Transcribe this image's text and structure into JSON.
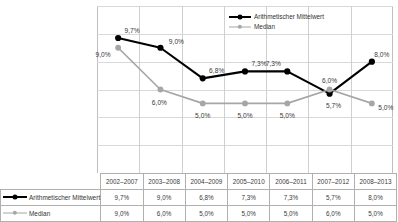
{
  "chart_data": {
    "type": "line",
    "title": "",
    "subtitle": "",
    "xlabel": "",
    "ylabel": "",
    "ylim": [
      0,
      12
    ],
    "ytick_step": 2,
    "ytick_labels": [
      "0,0%",
      "2,0%",
      "4,0%",
      "6,0%",
      "8,0%",
      "10,0%",
      "12,0%"
    ],
    "ytick_values": [
      0,
      2,
      4,
      6,
      8,
      10,
      12
    ],
    "grid": true,
    "legend_position": "top-right",
    "categories": [
      "2002–2007",
      "2003–2008",
      "2004–2009",
      "2005–2010",
      "2006–2011",
      "2007–2012",
      "2008–2013"
    ],
    "series": [
      {
        "name": "Arithmetischer Mittelwert",
        "color": "#000000",
        "marker": "circle",
        "values": [
          9.7,
          9.0,
          6.8,
          7.3,
          7.3,
          5.7,
          8.0
        ],
        "labels": [
          "9,7%",
          "9,0%",
          "6,8%",
          "7,3%",
          "7,3%",
          "5,7%",
          "8,0%"
        ]
      },
      {
        "name": "Median",
        "color": "#a6a6a6",
        "marker": "circle",
        "values": [
          9.0,
          6.0,
          5.0,
          5.0,
          5.0,
          6.0,
          5.0
        ],
        "labels": [
          "9,0%",
          "6,0%",
          "5,0%",
          "5,0%",
          "5,0%",
          "6,0%",
          "5,0%"
        ]
      }
    ]
  },
  "legend": {
    "mean_label": "Arithmetischer Mittelwert",
    "median_label": "Median"
  },
  "table": {
    "row_headers": [
      "Arithmetischer Mittelwert",
      "Median"
    ],
    "columns": [
      "2002–2007",
      "2003–2008",
      "2004–2009",
      "2005–2010",
      "2006–2011",
      "2007–2012",
      "2008–2013"
    ],
    "rows": [
      [
        "9,7%",
        "9,0%",
        "6,8%",
        "7,3%",
        "7,3%",
        "5,7%",
        "8,0%"
      ],
      [
        "9,0%",
        "6,0%",
        "5,0%",
        "5,0%",
        "5,0%",
        "6,0%",
        "5,0%"
      ]
    ]
  },
  "colors": {
    "mean": "#000000",
    "median": "#a6a6a6",
    "grid": "#d9d9d9",
    "frame": "#bfbfbf",
    "text": "#3a3a3a"
  }
}
